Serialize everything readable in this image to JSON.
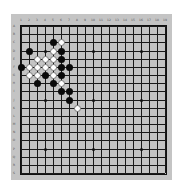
{
  "board": {
    "size": 19,
    "background": "#c4c4c4",
    "line_color": "#1a1a1a",
    "column_labels": [
      "1",
      "2",
      "3",
      "4",
      "5",
      "6",
      "7",
      "8",
      "9",
      "10",
      "11",
      "12",
      "13",
      "14",
      "15",
      "16",
      "17",
      "18",
      "19"
    ],
    "row_labels": [
      "A",
      "B",
      "C",
      "D",
      "E",
      "F",
      "G",
      "H",
      "I",
      "J",
      "K",
      "L",
      "M",
      "N",
      "O",
      "P",
      "Q",
      "R",
      "S"
    ],
    "star_points": [
      {
        "col": 4,
        "row": 4
      },
      {
        "col": 10,
        "row": 4
      },
      {
        "col": 16,
        "row": 4
      },
      {
        "col": 4,
        "row": 10
      },
      {
        "col": 10,
        "row": 10
      },
      {
        "col": 16,
        "row": 10
      },
      {
        "col": 4,
        "row": 16
      },
      {
        "col": 10,
        "row": 16
      },
      {
        "col": 16,
        "row": 16
      }
    ],
    "stones": [
      {
        "color": "black",
        "col": 5,
        "row": 3,
        "pos": "C5"
      },
      {
        "color": "white",
        "col": 6,
        "row": 3,
        "pos": "C6"
      },
      {
        "color": "black",
        "col": 2,
        "row": 4,
        "pos": "D2"
      },
      {
        "color": "white",
        "col": 5,
        "row": 4,
        "pos": "D5"
      },
      {
        "color": "black",
        "col": 6,
        "row": 4,
        "pos": "D6"
      },
      {
        "color": "white",
        "col": 3,
        "row": 5,
        "pos": "E3"
      },
      {
        "color": "white",
        "col": 4,
        "row": 5,
        "pos": "E4"
      },
      {
        "color": "white",
        "col": 5,
        "row": 5,
        "pos": "E5"
      },
      {
        "color": "black",
        "col": 6,
        "row": 5,
        "pos": "E6"
      },
      {
        "color": "black",
        "col": 1,
        "row": 6,
        "pos": "F1"
      },
      {
        "color": "white",
        "col": 2,
        "row": 6,
        "pos": "F2"
      },
      {
        "color": "white",
        "col": 3,
        "row": 6,
        "pos": "F3"
      },
      {
        "color": "white",
        "col": 4,
        "row": 6,
        "pos": "F4"
      },
      {
        "color": "white",
        "col": 5,
        "row": 6,
        "pos": "F5"
      },
      {
        "color": "black",
        "col": 6,
        "row": 6,
        "pos": "F6"
      },
      {
        "color": "black",
        "col": 7,
        "row": 6,
        "pos": "F7"
      },
      {
        "color": "white",
        "col": 2,
        "row": 7,
        "pos": "G2"
      },
      {
        "color": "white",
        "col": 3,
        "row": 7,
        "pos": "G3"
      },
      {
        "color": "black",
        "col": 4,
        "row": 7,
        "pos": "G4"
      },
      {
        "color": "white",
        "col": 5,
        "row": 7,
        "pos": "G5"
      },
      {
        "color": "black",
        "col": 6,
        "row": 7,
        "pos": "G6"
      },
      {
        "color": "black",
        "col": 3,
        "row": 8,
        "pos": "H3"
      },
      {
        "color": "black",
        "col": 5,
        "row": 8,
        "pos": "H5"
      },
      {
        "color": "white",
        "col": 6,
        "row": 8,
        "pos": "H6"
      },
      {
        "color": "black",
        "col": 6,
        "row": 9,
        "pos": "I6"
      },
      {
        "color": "black",
        "col": 7,
        "row": 9,
        "pos": "I7"
      },
      {
        "color": "black",
        "col": 7,
        "row": 10,
        "pos": "J7"
      },
      {
        "color": "white",
        "col": 8,
        "row": 11,
        "pos": "K8"
      }
    ]
  }
}
